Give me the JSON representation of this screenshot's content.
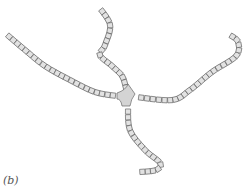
{
  "figure": {
    "label": "(b)",
    "colors": {
      "segment_fill": "#e2e2e2",
      "segment_stroke": "#666666",
      "junction_fill": "#d4d4d4",
      "background": "#ffffff"
    },
    "junction": {
      "x": 126,
      "y": 96
    },
    "arms": [
      {
        "name": "left-arm",
        "path": [
          [
            5,
            33
          ],
          [
            25,
            50
          ],
          [
            45,
            66
          ],
          [
            70,
            80
          ],
          [
            95,
            92
          ],
          [
            117,
            96
          ]
        ]
      },
      {
        "name": "top-arm",
        "path": [
          [
            99,
            7
          ],
          [
            110,
            25
          ],
          [
            105,
            45
          ],
          [
            100,
            55
          ],
          [
            112,
            66
          ],
          [
            122,
            76
          ],
          [
            126,
            88
          ]
        ]
      },
      {
        "name": "right-arm",
        "path": [
          [
            136,
            97
          ],
          [
            172,
            100
          ],
          [
            190,
            90
          ],
          [
            212,
            72
          ],
          [
            236,
            56
          ],
          [
            238,
            42
          ],
          [
            230,
            35
          ]
        ]
      },
      {
        "name": "bottom-arm",
        "path": [
          [
            128,
            106
          ],
          [
            130,
            130
          ],
          [
            145,
            150
          ],
          [
            160,
            163
          ],
          [
            156,
            170
          ],
          [
            140,
            172
          ]
        ]
      }
    ]
  }
}
